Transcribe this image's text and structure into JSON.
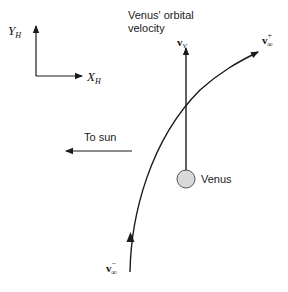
{
  "diagram": {
    "axes": {
      "y_label": "Y",
      "y_subscript": "H",
      "x_label": "X",
      "x_subscript": "H"
    },
    "orbital_velocity_caption": {
      "line1": "Venus' orbital",
      "line2": "velocity"
    },
    "vectors": {
      "venus_velocity": {
        "symbol": "v",
        "subscript": "V"
      },
      "v_inf_out": {
        "symbol": "v",
        "subscript": "∞",
        "superscript": "+"
      },
      "v_inf_in": {
        "symbol": "v",
        "subscript": "∞",
        "superscript": "−"
      }
    },
    "to_sun_label": "To sun",
    "planet_label": "Venus",
    "colors": {
      "line": "#1a1a1a",
      "planet_fill": "#d9d9d9",
      "planet_stroke": "#555555",
      "background": "#ffffff"
    }
  }
}
